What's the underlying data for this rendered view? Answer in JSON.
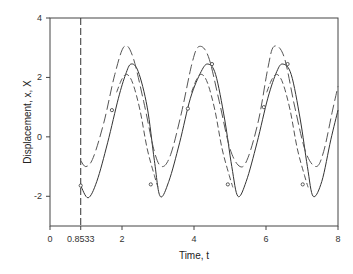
{
  "chart_data": {
    "type": "line",
    "title": "",
    "xlabel": "Time, t",
    "ylabel": "Displacement, x, X",
    "xlim": [
      0,
      8
    ],
    "ylim": [
      -3,
      4
    ],
    "xticks": [
      0,
      0.8533,
      2,
      4,
      6,
      8
    ],
    "xtick_labels": [
      "0",
      "0.8533",
      "2",
      "4",
      "6",
      "8"
    ],
    "yticks": [
      -2,
      0,
      2,
      4
    ],
    "ytick_labels": [
      "-2",
      "0",
      "2",
      "4"
    ],
    "grid": false,
    "legend": null,
    "annotations": [
      {
        "type": "vertical-dashed-line",
        "x": 0.8533
      }
    ],
    "series": [
      {
        "name": "X (solid, with circle markers)",
        "style": "solid",
        "color": "#333333",
        "x": [
          0.853,
          1.06,
          1.3,
          1.6,
          1.9,
          2.1,
          2.25,
          2.45,
          2.7,
          2.9,
          3.06,
          3.3,
          3.6,
          3.9,
          4.2,
          4.39,
          4.6,
          4.85,
          5.05,
          5.22,
          5.45,
          5.75,
          6.05,
          6.3,
          6.47,
          6.7,
          6.95,
          7.15,
          7.31,
          7.55,
          7.8,
          8.0
        ],
        "values": [
          -1.64,
          -2.05,
          -1.5,
          -0.2,
          1.3,
          2.1,
          2.45,
          2.2,
          1.0,
          -0.8,
          -2.0,
          -1.5,
          -0.2,
          1.3,
          2.2,
          2.45,
          2.1,
          0.6,
          -1.0,
          -2.0,
          -1.5,
          -0.2,
          1.3,
          2.2,
          2.45,
          2.1,
          0.6,
          -1.0,
          -2.0,
          -1.5,
          -0.1,
          0.9
        ],
        "markers": [
          [
            0.853,
            -1.64
          ],
          [
            1.72,
            0.9
          ],
          [
            2.8,
            -1.6
          ],
          [
            3.83,
            0.95
          ],
          [
            4.5,
            2.45
          ],
          [
            4.94,
            -1.6
          ],
          [
            5.94,
            1.0
          ],
          [
            6.6,
            2.45
          ],
          [
            7.02,
            -1.6
          ]
        ]
      },
      {
        "name": "x (long dash, upper)",
        "style": "long-dash",
        "color": "#555555",
        "x": [
          0.853,
          1.0,
          1.2,
          1.5,
          1.8,
          2.06,
          2.3,
          2.6,
          2.9,
          3.11,
          3.35,
          3.65,
          3.95,
          4.14,
          4.4,
          4.7,
          5.0,
          5.28,
          5.5,
          5.8,
          6.05,
          6.22,
          6.5,
          6.8,
          7.1,
          7.39,
          7.6,
          7.85,
          8.0
        ],
        "values": [
          -0.8,
          -1.0,
          -0.7,
          0.5,
          2.1,
          3.04,
          2.7,
          1.2,
          -0.5,
          -1.0,
          -0.6,
          0.8,
          2.5,
          3.04,
          2.7,
          1.2,
          -0.4,
          -1.0,
          -0.7,
          0.6,
          2.3,
          3.04,
          2.7,
          1.0,
          -0.5,
          -1.0,
          -0.5,
          0.9,
          1.7
        ]
      },
      {
        "name": "inner dashed (segments)",
        "style": "short-dash",
        "color": "#555555",
        "segments": [
          {
            "x": [
              1.85,
              2.0,
              2.14,
              2.3,
              2.5,
              2.7,
              2.9,
              3.0
            ],
            "values": [
              1.5,
              1.95,
              2.1,
              1.8,
              0.9,
              -0.4,
              -1.3,
              -1.7
            ]
          },
          {
            "x": [
              3.93,
              4.08,
              4.22,
              4.38,
              4.58,
              4.78,
              4.98,
              5.08
            ],
            "values": [
              1.5,
              1.95,
              2.1,
              1.8,
              0.9,
              -0.4,
              -1.3,
              -1.7
            ]
          },
          {
            "x": [
              6.02,
              6.17,
              6.31,
              6.47,
              6.67,
              6.87,
              7.07,
              7.17
            ],
            "values": [
              1.5,
              1.95,
              2.1,
              1.8,
              0.9,
              -0.4,
              -1.3,
              -1.7
            ]
          }
        ]
      }
    ]
  },
  "colors": {
    "axis": "#444444",
    "background": "#ffffff"
  }
}
